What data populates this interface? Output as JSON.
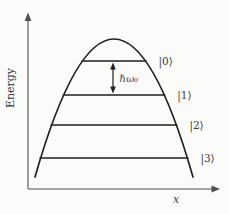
{
  "figure": {
    "background": "#fbfbf9",
    "line_color": "#1f1f1f",
    "axis_color": "#4f4f4f",
    "text_color": "#3b3b3b",
    "axes": {
      "y_label": "Energy",
      "x_label": "x"
    },
    "potential": {
      "shape": "inverted-parabola",
      "apex_x": 114,
      "apex_y": 39,
      "base_y": 177,
      "base_half_width": 79
    },
    "levels": [
      {
        "index": 0,
        "label": "|0⟩",
        "y": 61
      },
      {
        "index": 1,
        "label": "|1⟩",
        "y": 95
      },
      {
        "index": 2,
        "label": "|2⟩",
        "y": 125
      },
      {
        "index": 3,
        "label": "|3⟩",
        "y": 158
      }
    ],
    "spacing": {
      "label": "ℏω₀",
      "between": [
        "|0⟩",
        "|1⟩"
      ],
      "arrow_x": 113
    }
  }
}
